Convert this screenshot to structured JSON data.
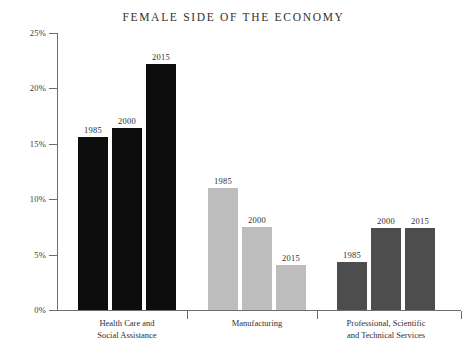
{
  "chart_data": {
    "type": "bar",
    "title": "FEMALE SIDE OF THE ECONOMY",
    "xlabel": "",
    "ylabel": "",
    "ylim": [
      0,
      25
    ],
    "y_tick_labels": [
      "25%",
      "20%",
      "15%",
      "10%",
      "5%",
      "0%"
    ],
    "y_tick_values": [
      25,
      20,
      15,
      10,
      5,
      0
    ],
    "grid": false,
    "legend": "none",
    "value_labels_shown": true,
    "categories": [
      "Health Care and Social Assistance",
      "Manufacturing",
      "Professional, Scientific and Technical Services"
    ],
    "series": [
      {
        "name": "1985",
        "values": [
          15.6,
          11.0,
          4.3
        ]
      },
      {
        "name": "2000",
        "values": [
          16.4,
          7.5,
          7.4
        ]
      },
      {
        "name": "2015",
        "values": [
          22.2,
          4.1,
          7.4
        ]
      }
    ],
    "group_colors": [
      "#0d0d0d",
      "#bdbdbd",
      "#4d4d4d"
    ],
    "groups": [
      {
        "label_line1": "Health Care and",
        "label_line2": "Social Assistance",
        "color": "#0d0d0d",
        "bars": [
          {
            "year": "1985",
            "value": 15.6
          },
          {
            "year": "2000",
            "value": 16.4
          },
          {
            "year": "2015",
            "value": 22.2
          }
        ]
      },
      {
        "label_line1": "Manufacturing",
        "label_line2": "",
        "color": "#bdbdbd",
        "bars": [
          {
            "year": "1985",
            "value": 11.0
          },
          {
            "year": "2000",
            "value": 7.5
          },
          {
            "year": "2015",
            "value": 4.1
          }
        ]
      },
      {
        "label_line1": "Professional, Scientific",
        "label_line2": "and Technical Services",
        "color": "#4d4d4d",
        "bars": [
          {
            "year": "1985",
            "value": 4.3
          },
          {
            "year": "2000",
            "value": 7.4
          },
          {
            "year": "2015",
            "value": 7.4
          }
        ]
      }
    ]
  },
  "axis": {
    "axis_color": "#6e6e6e"
  }
}
